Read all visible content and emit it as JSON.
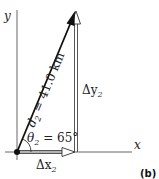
{
  "figure": {
    "panel_label": "(b)",
    "axes": {
      "x_label": "x",
      "y_label": "y"
    },
    "vectors": {
      "resultant": {
        "symbol": "d",
        "subscript": "2",
        "equals": " = ",
        "value": "41.0 km"
      },
      "x_component": {
        "symbol": "Δx",
        "subscript": "2"
      },
      "y_component": {
        "symbol": "Δy",
        "subscript": "2"
      }
    },
    "angle": {
      "symbol": "θ",
      "subscript": "2",
      "equals": " = ",
      "value": "65°"
    },
    "colors": {
      "vector": "#111111",
      "component_fill": "#ffffff",
      "axis": "#333333",
      "text": "#222222"
    }
  }
}
